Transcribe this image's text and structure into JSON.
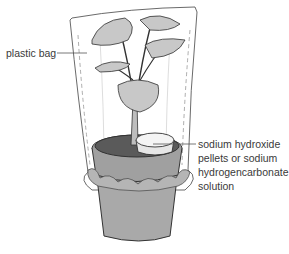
{
  "diagram": {
    "labels": {
      "plastic_bag": "plastic bag",
      "sodium_hydroxide": {
        "line1": "sodium hydroxide",
        "line2": "pellets or sodium",
        "line3": "hydrogencarbonate",
        "line4": "solution"
      }
    },
    "components": [
      "plastic bag",
      "potted plant",
      "soil",
      "dish of sodium hydroxide / sodium hydrogencarbonate",
      "pot"
    ],
    "colors": {
      "leaf_fill": "#c8c8c8",
      "soil_fill": "#5a5a5a",
      "pot_fill": "#a9a9a9",
      "outline": "#333333",
      "leader_line": "#555555"
    }
  }
}
